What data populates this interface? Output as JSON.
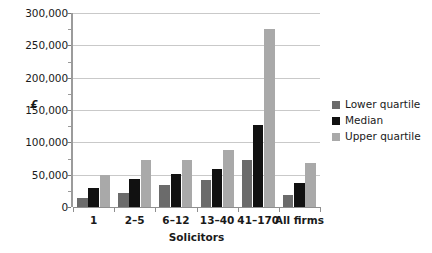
{
  "chart_data": {
    "type": "bar",
    "title": "",
    "xlabel": "Solicitors",
    "ylabel": "£",
    "categories": [
      "1",
      "2–5",
      "6–12",
      "13–40",
      "41–170",
      "All firms"
    ],
    "series": [
      {
        "name": "Lower quartile",
        "color": "#6b6b6b",
        "values": [
          14000,
          22000,
          34000,
          42000,
          73000,
          18000
        ]
      },
      {
        "name": "Median",
        "color": "#111111",
        "values": [
          29000,
          44000,
          51000,
          59000,
          127000,
          37000
        ]
      },
      {
        "name": "Upper quartile",
        "color": "#a9a9a9",
        "values": [
          50000,
          72000,
          72000,
          88000,
          275000,
          68000
        ]
      }
    ],
    "ylim": [
      0,
      300000
    ],
    "ytick_values": [
      0,
      50000,
      100000,
      150000,
      200000,
      250000,
      300000
    ],
    "ytick_labels": [
      "0",
      "50,000",
      "100,000",
      "150,000",
      "200,000",
      "250,000",
      "300,000"
    ],
    "yminor_tick_values": [
      25000,
      75000,
      125000,
      175000,
      225000,
      275000
    ],
    "grid": true,
    "grid_axis": "y",
    "legend_position": "right",
    "legend_entries": [
      "Lower quartile",
      "Median",
      "Upper quartile"
    ]
  }
}
